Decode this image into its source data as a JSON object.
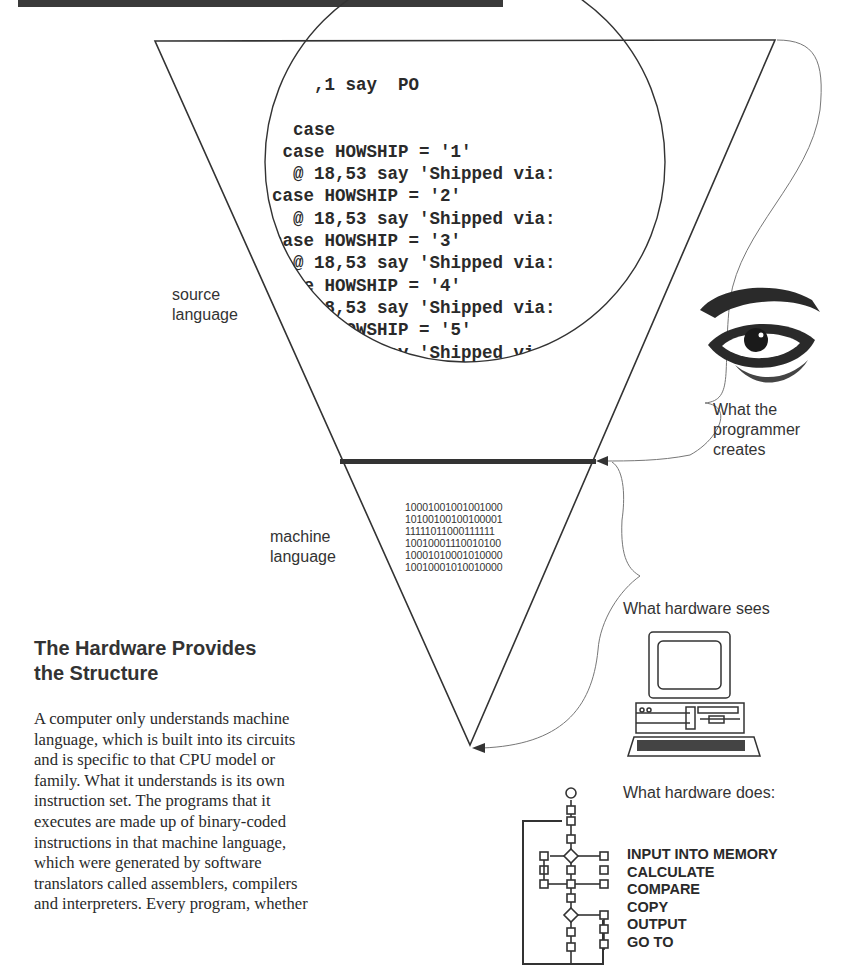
{
  "page": {
    "heading_lines": [
      "The Hardware Provides",
      "the Structure"
    ],
    "body_lines": [
      "A computer only understands machine",
      "language, which is built into its circuits",
      "and is specific to that CPU model or",
      "family.  What it understands is its own",
      "instruction set.  The programs that it",
      "executes are made up of binary-coded",
      "instructions in that machine language,",
      "which were generated by software",
      "translators called assemblers, compilers",
      "and interpreters.  Every program, whether"
    ]
  },
  "diagram": {
    "source_label": [
      "source",
      "language"
    ],
    "machine_label": [
      "machine",
      "language"
    ],
    "source_code_lines": [
      "    ,1 say  PO",
      "   ",
      "  case",
      " case HOWSHIP = '1'",
      "  @ 18,53 say 'Shipped via:",
      "case HOWSHIP = '2'",
      "  @ 18,53 say 'Shipped via:",
      "case HOWSHIP = '3'",
      "  @ 18,53 say 'Shipped via:",
      "case HOWSHIP = '4'",
      "  @ 18,53 say 'Shipped via:",
      " case HOWSHIP = '5'",
      "  @ 18,53 say 'Shipped vi",
      "otherwise",
      " @ 18,53 say 'Picked"
    ],
    "binary_lines": [
      "10001001001001000",
      "10100100100100001",
      "11111011000111111",
      "10010001110010100",
      "10001010001010000",
      "10010001010010000"
    ],
    "programmer_caption": [
      "What the",
      "programmer",
      "creates"
    ],
    "hardware_sees": "What hardware sees",
    "hardware_does": "What hardware does:",
    "operations": [
      "INPUT INTO MEMORY",
      "CALCULATE",
      "COMPARE",
      "COPY",
      "OUTPUT",
      "GO TO"
    ],
    "icons": {
      "eye": "eye-illustration",
      "computer": "desktop-computer-illustration",
      "flowchart": "flowchart-illustration"
    },
    "colors": {
      "ink": "#222222",
      "line": "#333333",
      "rule": "#3a3a3a",
      "curve": "#666666"
    }
  }
}
